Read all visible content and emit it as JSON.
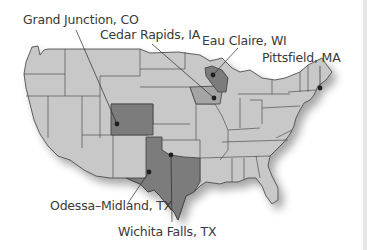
{
  "map": {
    "title": "US Map with highlighted metro areas",
    "colors": {
      "land": "#c8c8c8",
      "border": "#3c3c3c",
      "highlight_dark": "#7c7c7c",
      "highlight_medium": "#a5a5a5",
      "marker": "#1e1e1e",
      "label": "#3a3a3a"
    },
    "labels": [
      {
        "text": "Grand Junction, CO",
        "state": "CO"
      },
      {
        "text": "Cedar Rapids, IA",
        "state": "IA"
      },
      {
        "text": "Eau Claire, WI",
        "state": "WI"
      },
      {
        "text": "Pittsfield, MA",
        "state": "MA"
      },
      {
        "text": "Odessa–Midland, TX",
        "state": "TX"
      },
      {
        "text": "Wichita Falls, TX",
        "state": "TX"
      }
    ]
  }
}
